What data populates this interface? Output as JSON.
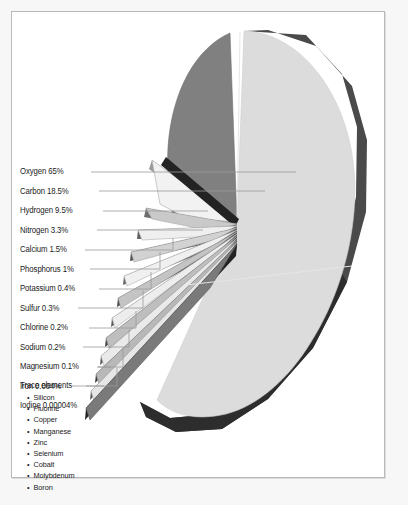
{
  "figure": {
    "background_color": "#f7f7f7",
    "panel_color": "#ffffff",
    "panel_border_color": "#b9b9b9"
  },
  "colors": {
    "slice_light": "#dcdcdc",
    "slice_mid": "#808080",
    "slice_dark": "#4a4a4a",
    "slice_darkest": "#2d2d2d",
    "slice_white": "#f2f2f2",
    "leader_line": "#9a9a9a",
    "text": "#1b1b1b"
  },
  "chart_data": {
    "type": "pie",
    "title": "",
    "xlabel": "",
    "ylabel": "",
    "legend_position": "left-callouts",
    "grid": false,
    "style": "exploded 3-D pie chart, tilted, slices fanned out to the lower left",
    "unit": "percent of body mass",
    "categories": [
      "Oxygen",
      "Carbon",
      "Hydrogen",
      "Nitrogen",
      "Calcium",
      "Phosphorus",
      "Potassium",
      "Sulfur",
      "Chlorine",
      "Sodium",
      "Magnesium",
      "Iron",
      "Iodine"
    ],
    "values": [
      65,
      18.5,
      9.5,
      3.3,
      1.5,
      1,
      0.4,
      0.3,
      0.2,
      0.2,
      0.1,
      0.004,
      4e-05
    ],
    "value_labels": [
      "65%",
      "18.5%",
      "9.5%",
      "3.3%",
      "1.5%",
      "1%",
      "0.4%",
      "0.3%",
      "0.2%",
      "0.2%",
      "0.1%",
      "0.004%",
      "0.00004%"
    ],
    "callouts": [
      {
        "label": "Oxygen 65%",
        "name": "Oxygen",
        "value": 65,
        "value_text": "65%"
      },
      {
        "label": "Carbon 18.5%",
        "name": "Carbon",
        "value": 18.5,
        "value_text": "18.5%"
      },
      {
        "label": "Hydrogen 9.5%",
        "name": "Hydrogen",
        "value": 9.5,
        "value_text": "9.5%"
      },
      {
        "label": "Nitrogen 3.3%",
        "name": "Nitrogen",
        "value": 3.3,
        "value_text": "3.3%"
      },
      {
        "label": "Calcium 1.5%",
        "name": "Calcium",
        "value": 1.5,
        "value_text": "1.5%"
      },
      {
        "label": "Phosphorus 1%",
        "name": "Phosphorus",
        "value": 1,
        "value_text": "1%"
      },
      {
        "label": "Potassium 0.4%",
        "name": "Potassium",
        "value": 0.4,
        "value_text": "0.4%"
      },
      {
        "label": "Sulfur 0.3%",
        "name": "Sulfur",
        "value": 0.3,
        "value_text": "0.3%"
      },
      {
        "label": "Chlorine 0.2%",
        "name": "Chlorine",
        "value": 0.2,
        "value_text": "0.2%"
      },
      {
        "label": "Sodium 0.2%",
        "name": "Sodium",
        "value": 0.2,
        "value_text": "0.2%"
      },
      {
        "label": "Magnesium 0.1%",
        "name": "Magnesium",
        "value": 0.1,
        "value_text": "0.1%"
      },
      {
        "label": "Iron 0.004%",
        "name": "Iron",
        "value": 0.004,
        "value_text": "0.004%"
      },
      {
        "label": "Iodine 0.00004%",
        "name": "Iodine",
        "value": 4e-05,
        "value_text": "0.00004%"
      },
      {
        "label": "Trace elements",
        "name": "Trace elements",
        "value": null,
        "value_text": ""
      }
    ],
    "trace_elements": [
      "Silicon",
      "Fluorine",
      "Copper",
      "Manganese",
      "Zinc",
      "Selenium",
      "Cobalt",
      "Molybdenum",
      "Boron"
    ]
  }
}
